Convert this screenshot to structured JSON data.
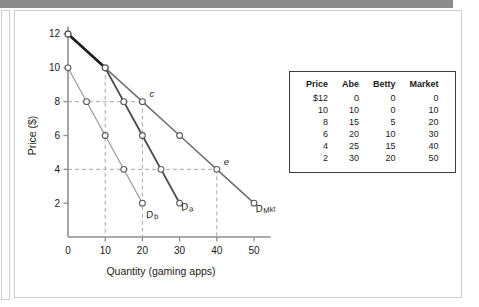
{
  "figure": {
    "axes": {
      "xlabel": "Quantity (gaming apps)",
      "ylabel": "Price ($)",
      "xticks": [
        "0",
        "10",
        "20",
        "30",
        "40",
        "50"
      ],
      "yticks": [
        "2",
        "4",
        "6",
        "8",
        "10",
        "12"
      ]
    },
    "curve_labels": {
      "betty": {
        "base": "D",
        "sub": "b"
      },
      "abe": {
        "base": "D",
        "sub": "a"
      },
      "market": {
        "base": "D",
        "sub": "Mkt"
      }
    },
    "point_labels": {
      "c": "c",
      "e": "e"
    }
  },
  "table": {
    "headers": [
      "Price",
      "Abe",
      "Betty",
      "Market"
    ],
    "rows": [
      [
        "$12",
        "0",
        "0",
        "0"
      ],
      [
        "10",
        "10",
        "0",
        "10"
      ],
      [
        "8",
        "15",
        "5",
        "20"
      ],
      [
        "6",
        "20",
        "10",
        "30"
      ],
      [
        "4",
        "25",
        "15",
        "40"
      ],
      [
        "2",
        "30",
        "20",
        "50"
      ]
    ]
  },
  "chart_data": {
    "type": "line",
    "title": "",
    "xlabel": "Quantity (gaming apps)",
    "ylabel": "Price ($)",
    "xlim": [
      0,
      55
    ],
    "ylim": [
      0,
      13
    ],
    "xticks": [
      0,
      10,
      20,
      30,
      40,
      50
    ],
    "yticks": [
      2,
      4,
      6,
      8,
      10,
      12
    ],
    "grid": false,
    "legend": "inline-curve-labels",
    "prices": [
      12,
      10,
      8,
      6,
      4,
      2
    ],
    "series": [
      {
        "name": "D_a",
        "label": "Abe",
        "color": "#4d4d4d",
        "points": [
          {
            "q": 0,
            "p": 12
          },
          {
            "q": 10,
            "p": 10
          },
          {
            "q": 15,
            "p": 8
          },
          {
            "q": 20,
            "p": 6
          },
          {
            "q": 25,
            "p": 4
          },
          {
            "q": 30,
            "p": 2
          }
        ]
      },
      {
        "name": "D_b",
        "label": "Betty",
        "color": "#9a9a9a",
        "points": [
          {
            "q": 0,
            "p": 10
          },
          {
            "q": 5,
            "p": 8
          },
          {
            "q": 10,
            "p": 6
          },
          {
            "q": 15,
            "p": 4
          },
          {
            "q": 20,
            "p": 2
          }
        ]
      },
      {
        "name": "D_Mkt",
        "label": "Market",
        "color": "#6e6e6e",
        "points": [
          {
            "q": 0,
            "p": 12
          },
          {
            "q": 10,
            "p": 10
          },
          {
            "q": 20,
            "p": 8
          },
          {
            "q": 30,
            "p": 6
          },
          {
            "q": 40,
            "p": 4
          },
          {
            "q": 50,
            "p": 2
          }
        ]
      }
    ],
    "annotations": [
      {
        "text": "c",
        "q": 20,
        "p": 8,
        "series": "D_Mkt"
      },
      {
        "text": "e",
        "q": 40,
        "p": 4,
        "series": "D_Mkt"
      }
    ],
    "guides": {
      "horizontal_prices": [
        8,
        4
      ],
      "vertical_quantities": [
        10,
        20,
        40
      ]
    }
  }
}
